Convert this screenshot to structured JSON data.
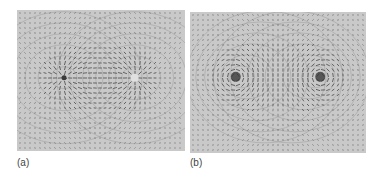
{
  "figure": {
    "panels": [
      {
        "id": "a",
        "label": "(a)",
        "description": "Vector field of two opposite point charges (dipole) with equipotential contours",
        "sources": [
          {
            "type": "sink",
            "x": 0.28,
            "y": 0.48
          },
          {
            "type": "source",
            "x": 0.7,
            "y": 0.48
          }
        ]
      },
      {
        "id": "b",
        "label": "(b)",
        "description": "Vector field of two counter-rotating line currents (magnetic dipole-like) with circular field lines",
        "sources": [
          {
            "type": "vortex-ccw",
            "x": 0.26,
            "y": 0.46
          },
          {
            "type": "vortex-cw",
            "x": 0.74,
            "y": 0.46
          }
        ]
      }
    ],
    "colors": {
      "panel_bg": "#c9c9c9",
      "arrow": "#555555",
      "contour": "#9a9a9a",
      "core": "#3a3a3a"
    }
  }
}
